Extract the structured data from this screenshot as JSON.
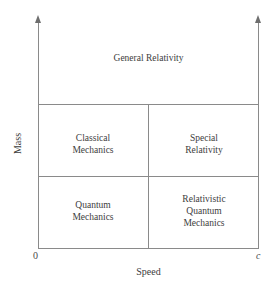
{
  "diagram": {
    "type": "quadrant-diagram",
    "axes": {
      "x": {
        "title": "Speed",
        "origin_label": "0",
        "max_label": "c",
        "arrow": "arrow-up-icon"
      },
      "y": {
        "title": "Mass",
        "arrow": "arrow-up-icon"
      }
    },
    "regions": [
      {
        "name": "general-relativity",
        "label": "General Relativity",
        "position": "top-full-width"
      },
      {
        "name": "classical-mechanics",
        "label": "Classical\nMechanics",
        "position": "middle-left"
      },
      {
        "name": "special-relativity",
        "label": "Special\nRelativity",
        "position": "middle-right"
      },
      {
        "name": "quantum-mechanics",
        "label": "Quantum\nMechanics",
        "position": "bottom-left"
      },
      {
        "name": "relativistic-quantum-mechanics",
        "label": "Relativistic\nQuantum\nMechanics",
        "position": "bottom-right"
      }
    ],
    "colors": {
      "line": "#8a8a8a",
      "arrow": "#6e6e6e",
      "text": "#3d3d3d",
      "background": "#ffffff"
    }
  }
}
